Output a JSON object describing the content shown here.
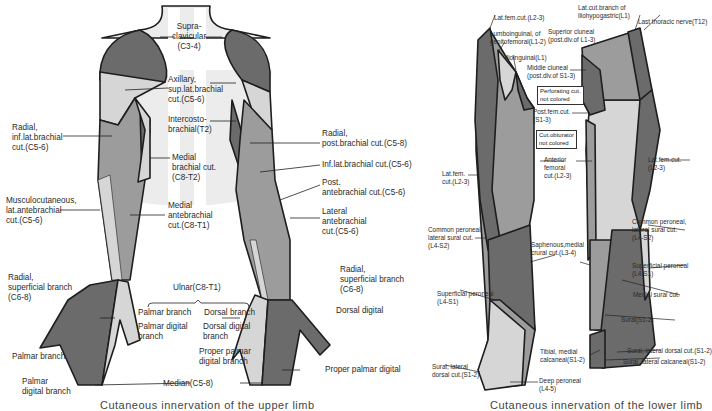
{
  "colors": {
    "dark": "#6b6b6b",
    "mid": "#9c9c9c",
    "light": "#d6d6d6",
    "pale": "#ececec",
    "outline": "#1e1e1e"
  },
  "upper_limb": {
    "labels": {
      "supraclavicular": "Supra-\nclavicular\n(C3-4)",
      "axillary": "Axillary,\nsup.lat.brachial\ncut.(C5-6)",
      "intercostobrachial": "Intercosto-\nbrachial(T2)",
      "radial_inf_lat_brachial": "Radial,\ninf.lat.brachial\ncut.(C5-6)",
      "medial_brachial": "Medial\nbrachial cut.\n(C8-T2)",
      "musculocutaneous": "Musculocutaneous,\nlat.antebrachial\ncut.(C5-6)",
      "medial_antebrachial": "Medial\nantebrachial\ncut.(C8-T1)",
      "radial_post_brachial": "Radial,\npost.brachial cut.(C5-8)",
      "inf_lat_brachial": "Inf.lat.brachial cut.(C5-6)",
      "post_antebrachial": "Post.\nantebrachial cut.(C5-6)",
      "lateral_antebrachial": "Lateral\nantebrachial\ncut.(C5-6)",
      "radial_superficial_left": "Radial,\nsuperficial branch\n(C6-8)",
      "radial_superficial_right": "Radial,\nsuperficial branch\n(C6-8)",
      "ulnar": "Ulnar(C8-T1)",
      "ulnar_palmar_branch": "Palmar branch",
      "ulnar_palmar_digital": "Palmar digital\nbranch",
      "ulnar_dorsal_branch": "Dorsal branch",
      "ulnar_dorsal_digital": "Dorsal digital\nbranch",
      "ulnar_proper_palmar": "Proper palmar\ndigital branch",
      "median_palmar_branch": "Palmar branch",
      "median_palmar_digital": "Palmar\ndigital branch",
      "median": "Median(C5-8)",
      "dorsal_digital": "Dorsal digital",
      "proper_palmar_digital": "Proper palmar digital"
    },
    "caption": "Cutaneous innervation of the upper limb"
  },
  "lower_limb": {
    "labels": {
      "lat_fem_top": "Lat.fem.cut.(L2-3)",
      "lumboinguinal": "Lumboinguinal, of\ngenitofemoral(L1-2)",
      "ilioinguinal": "Ilioinguinal(L1)",
      "lat_cut_iliohypogastric": "Lat.cut.branch of\niliohypogastric(L1)",
      "last_thoracic": "Last thoracic nerve(T12)",
      "superior_cluneal": "Superior cluneal\n(post.div.of L1-3)",
      "middle_cluneal": "Middle cluneal\n(post.div.of S1-3)",
      "perforating_box": "Perforating cut.\nnot colored",
      "post_fem": "Post.fem.cut.\n(S1-3)",
      "obturator_box": "Cut.obturator\nnot colored",
      "anterior_femoral": "Anterior\nfemoral\ncut.(L2-3)",
      "lat_fem_left": "Lat.fem.\ncut.(L2-3)",
      "lat_fem_right": "Lat.fem.cut.\n(L2-3)",
      "common_peroneal_left": "Common peroneal,\nlateral sural cut.\n(L4-S2)",
      "common_peroneal_right": "Common peroneal,\nlateral sural cut.\n(L4-S2)",
      "saphenous": "Saphenous,medial\ncrural cut.(L3-4)",
      "superficial_peroneal_left": "Superficial peroneal\n(L4-S1)",
      "superficial_peroneal_right": "Superficial peroneal\n(L4-S1)",
      "medial_sural": "Medial sural cut.",
      "sural": "Sural(S1-2)",
      "tibial_medial_calcaneal": "Tibial, medial\ncalcaneal(S1-2)",
      "sural_lateral_dorsal_left": "Sural, lateral\ndorsal cut.(S1-2)",
      "sural_lateral_dorsal_right": "Sural, lateral dorsal cut.(S1-2)",
      "sural_lateral_calcaneal": "Sural, lateral calcaneal(S1-2)",
      "deep_peroneal": "Deep peroneal\n(L4-5)"
    },
    "caption": "Cutaneous innervation of the lower limb"
  }
}
